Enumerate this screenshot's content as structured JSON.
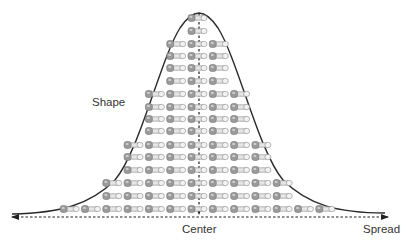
{
  "diagram": {
    "title": "",
    "labels": {
      "shape": "Shape",
      "center": "Center",
      "spread": "Spread"
    },
    "curve": {
      "type": "normal-distribution",
      "peak_x": 199,
      "peak_y": 13,
      "baseline_y": 214,
      "left_x": 12,
      "right_x": 385
    },
    "center_axis": {
      "x": 199,
      "y_top": 13,
      "y_bottom": 215,
      "style": "dashed-arrow-down"
    },
    "spread_axis": {
      "y": 217,
      "x_left": 12,
      "x_right": 388,
      "style": "dashed-double-arrow"
    },
    "item_icon": "bolt-icon",
    "rows": [
      {
        "y": 18,
        "count": 1
      },
      {
        "y": 31,
        "count": 1
      },
      {
        "y": 44,
        "count": 3
      },
      {
        "y": 56,
        "count": 3
      },
      {
        "y": 68,
        "count": 3
      },
      {
        "y": 81,
        "count": 3
      },
      {
        "y": 94,
        "count": 5
      },
      {
        "y": 107,
        "count": 5
      },
      {
        "y": 119,
        "count": 5
      },
      {
        "y": 131,
        "count": 5
      },
      {
        "y": 145,
        "count": 7
      },
      {
        "y": 157,
        "count": 7
      },
      {
        "y": 170,
        "count": 7
      },
      {
        "y": 183,
        "count": 9
      },
      {
        "y": 196,
        "count": 9
      },
      {
        "y": 209,
        "count": 13
      }
    ],
    "colors": {
      "line": "#222222",
      "bolt_head": "#9a9a9a",
      "bolt_shaft": "#e6e6e6",
      "bolt_outline": "#8a8a8a",
      "text": "#333333"
    }
  }
}
